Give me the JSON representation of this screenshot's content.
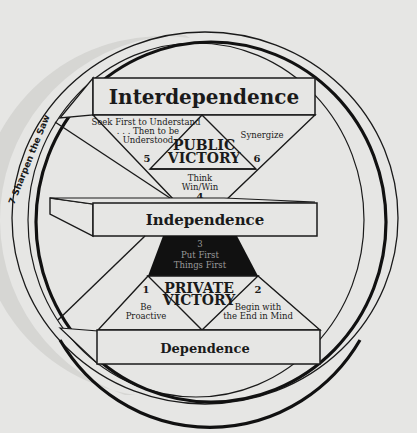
{
  "diagram": {
    "type": "Seven Habits maturity continuum",
    "colors": {
      "background": "#e6e6e4",
      "stroke": "#1a1a1a",
      "dark_triangle": "#111111",
      "saw_band": "#cfcfcc"
    },
    "outer_ring_label": "7  Sharpen the Saw",
    "levels": {
      "top": "Interdependence",
      "middle": "Independence",
      "bottom": "Dependence"
    },
    "victories": {
      "public": [
        "PUBLIC",
        "VICTORY"
      ],
      "private": [
        "PRIVATE",
        "VICTORY"
      ]
    },
    "habits": [
      {
        "number": "1",
        "lines": [
          "Be",
          "Proactive"
        ]
      },
      {
        "number": "2",
        "lines": [
          "Begin with",
          "the End in Mind"
        ]
      },
      {
        "number": "3",
        "lines": [
          "Put First",
          "Things First"
        ]
      },
      {
        "number": "4",
        "lines": [
          "Think",
          "Win/Win"
        ]
      },
      {
        "number": "5",
        "lines": [
          "Seek First to Understand",
          ". . . Then to be",
          "Understood"
        ]
      },
      {
        "number": "6",
        "lines": [
          "Synergize"
        ]
      }
    ]
  }
}
